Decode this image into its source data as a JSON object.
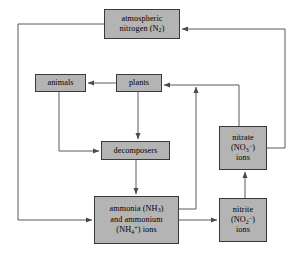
{
  "diagram": {
    "canvas": {
      "width": 301,
      "height": 261
    },
    "style": {
      "node_fill": "#b4b4b4",
      "node_border": "#3a3a3a",
      "edge_color": "#5a5a5a",
      "background": "#ffffff"
    },
    "nodes": [
      {
        "id": "atmospheric-nitrogen",
        "name": "atmospheric-nitrogen-box",
        "lines": [
          "atmospheric",
          "nitrogen (N₂)"
        ],
        "line1": "atmospheric",
        "line2_pre": "nitrogen (N",
        "line2_sub": "2",
        "line2_post": ")",
        "x": 104,
        "y": 9,
        "w": 76,
        "h": 30
      },
      {
        "id": "animals",
        "name": "animals-box",
        "lines": [
          "animals"
        ],
        "line1": "animals",
        "x": 35,
        "y": 74,
        "w": 51,
        "h": 18
      },
      {
        "id": "plants",
        "name": "plants-box",
        "lines": [
          "plants"
        ],
        "line1": "plants",
        "x": 116,
        "y": 74,
        "w": 46,
        "h": 18
      },
      {
        "id": "decomposers",
        "name": "decomposers-box",
        "lines": [
          "decomposers"
        ],
        "line1": "decomposers",
        "x": 101,
        "y": 141,
        "w": 69,
        "h": 19
      },
      {
        "id": "ammonia-ammonium",
        "name": "ammonia-ammonium-box",
        "lines": [
          "ammonia (NH₃)",
          "and ammonium",
          "(NH₄⁺) ions"
        ],
        "line1_pre": "ammonia (NH",
        "line1_sub": "3",
        "line1_post": ")",
        "line2": "and ammonium",
        "line3_pre": "(NH",
        "line3_sub": "4",
        "line3_sup": "+",
        "line3_post": ") ions",
        "x": 94,
        "y": 196,
        "w": 85,
        "h": 48
      },
      {
        "id": "nitrate",
        "name": "nitrate-box",
        "lines": [
          "nitrate",
          "(NO₃⁻)",
          "ions"
        ],
        "line1": "nitrate",
        "line2_pre": "(NO",
        "line2_sub": "3",
        "line2_sup": "−",
        "line2_post": ")",
        "line3": "ions",
        "x": 219,
        "y": 126,
        "w": 48,
        "h": 44
      },
      {
        "id": "nitrite",
        "name": "nitrite-box",
        "lines": [
          "nitrite",
          "(NO₂⁻)",
          "ions"
        ],
        "line1": "nitrite",
        "line2_pre": "(NO",
        "line2_sub": "2",
        "line2_sup": "−",
        "line2_post": ")",
        "line3": "ions",
        "x": 219,
        "y": 198,
        "w": 48,
        "h": 44
      }
    ],
    "edges": [
      {
        "id": "plants-to-animals",
        "name": "edge-plants-to-animals",
        "from": "plants",
        "to": "animals"
      },
      {
        "id": "plants-to-decomposers",
        "name": "edge-plants-to-decomposers",
        "from": "plants",
        "to": "decomposers"
      },
      {
        "id": "animals-to-decomposers",
        "name": "edge-animals-to-decomposers",
        "from": "animals",
        "to": "decomposers"
      },
      {
        "id": "decomposers-to-ammonia",
        "name": "edge-decomposers-to-ammonia",
        "from": "decomposers",
        "to": "ammonia-ammonium"
      },
      {
        "id": "atmospheric-to-ammonia",
        "name": "edge-atmospheric-to-ammonia",
        "from": "atmospheric-nitrogen",
        "to": "ammonia-ammonium"
      },
      {
        "id": "ammonia-to-nitrite",
        "name": "edge-ammonia-to-nitrite",
        "from": "ammonia-ammonium",
        "to": "nitrite"
      },
      {
        "id": "nitrite-to-nitrate",
        "name": "edge-nitrite-to-nitrate",
        "from": "nitrite",
        "to": "nitrate"
      },
      {
        "id": "nitrate-to-plants",
        "name": "edge-nitrate-to-plants",
        "from": "nitrate",
        "to": "plants"
      },
      {
        "id": "ammonia-to-plants",
        "name": "edge-ammonia-to-plants",
        "from": "ammonia-ammonium",
        "to": "plants"
      },
      {
        "id": "nitrate-to-atmospheric",
        "name": "edge-nitrate-to-atmospheric",
        "from": "nitrate",
        "to": "atmospheric-nitrogen"
      }
    ]
  }
}
